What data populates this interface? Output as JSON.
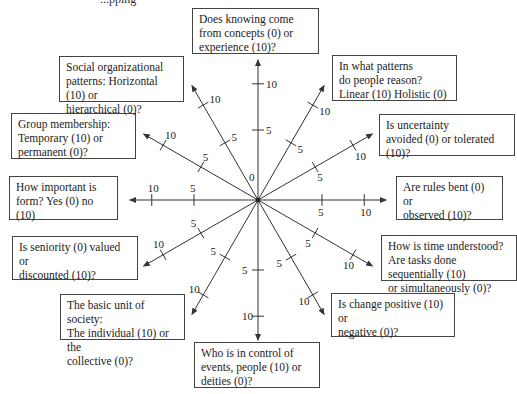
{
  "top_fragment": "...pping · ·",
  "center": {
    "x": 258,
    "y": 200,
    "label": "0"
  },
  "tick_labels": {
    "mid": "5",
    "end": "10"
  },
  "axes": [
    {
      "id": "knowing",
      "angle": 90,
      "question": [
        "Does knowing come",
        "from concepts (0) or",
        "experience (10)?"
      ],
      "box": {
        "x": 192,
        "y": 8,
        "w": 127,
        "h": 46
      }
    },
    {
      "id": "reasoning",
      "angle": 60,
      "question": [
        "In what patterns",
        "do people reason?",
        "Linear (10) Holistic (0)"
      ],
      "box": {
        "x": 332,
        "y": 55,
        "w": 125,
        "h": 46
      }
    },
    {
      "id": "uncertainty",
      "angle": 30,
      "question": [
        "Is uncertainty",
        "avoided (0) or tolerated (10)?"
      ],
      "box": {
        "x": 379,
        "y": 114,
        "w": 136,
        "h": 42
      }
    },
    {
      "id": "rules",
      "angle": 0,
      "question": [
        "Are rules bent (0) or",
        "observed (10)?"
      ],
      "box": {
        "x": 396,
        "y": 176,
        "w": 107,
        "h": 44
      }
    },
    {
      "id": "time",
      "angle": -30,
      "question": [
        "How is time understood?",
        "Are tasks done sequentially (10)",
        "or simultaneously (0)?"
      ],
      "box": {
        "x": 381,
        "y": 235,
        "w": 136,
        "h": 46
      }
    },
    {
      "id": "change",
      "angle": -60,
      "question": [
        "Is change positive (10) or",
        "negative (0)?"
      ],
      "box": {
        "x": 331,
        "y": 293,
        "w": 124,
        "h": 44
      }
    },
    {
      "id": "control",
      "angle": -90,
      "question": [
        "Who is in control of",
        "events, people (10) or",
        "deities (0)?"
      ],
      "box": {
        "x": 194,
        "y": 342,
        "w": 126,
        "h": 46
      }
    },
    {
      "id": "unit",
      "angle": -120,
      "question": [
        "The basic unit of society:",
        "The individual (10) or the",
        "collective (0)?"
      ],
      "box": {
        "x": 60,
        "y": 294,
        "w": 125,
        "h": 46
      }
    },
    {
      "id": "seniority",
      "angle": -150,
      "question": [
        "Is seniority (0) valued or",
        "discounted (10)?"
      ],
      "box": {
        "x": 12,
        "y": 236,
        "w": 126,
        "h": 44
      }
    },
    {
      "id": "form",
      "angle": 180,
      "question": [
        "How important is",
        "form? Yes (0) no (10)"
      ],
      "box": {
        "x": 9,
        "y": 176,
        "w": 109,
        "h": 44
      }
    },
    {
      "id": "group",
      "angle": 150,
      "question": [
        "Group membership:",
        "Temporary (10) or",
        "permanent (0)?"
      ],
      "box": {
        "x": 11,
        "y": 113,
        "w": 125,
        "h": 46
      }
    },
    {
      "id": "social",
      "angle": 120,
      "question": [
        "Social organizational",
        "patterns: Horizontal (10) or",
        "hierarchical (0)?"
      ],
      "box": {
        "x": 59,
        "y": 56,
        "w": 125,
        "h": 46
      }
    }
  ],
  "colors": {
    "line": "#333333",
    "box_border": "#444444",
    "background": "#ffffff"
  }
}
